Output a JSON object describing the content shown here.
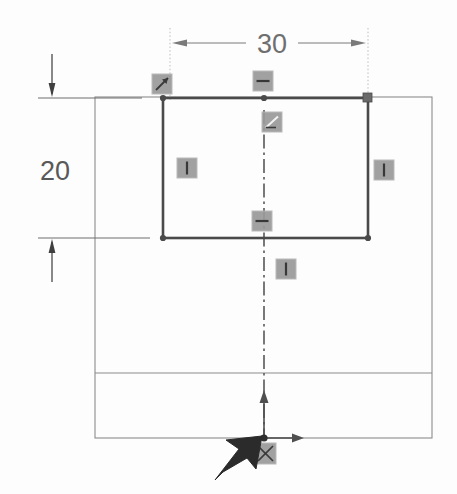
{
  "app": {
    "view_name": "sketch-canvas",
    "background_color": "#fdfdfd"
  },
  "colors": {
    "sketch_line": "#4a4a4a",
    "reference_line": "#8c8c8c",
    "centerline": "#6b6b6b",
    "dimension": "#7a7a7a",
    "dimension_text": "#6f6f6f",
    "constraint_icon_fill": "#9a9a9a",
    "constraint_icon_border": "#b5b5b5",
    "origin_arrow": "#4f4f4f",
    "cursor": "#2b2b2b",
    "handle_fill": "#6a6a6a"
  },
  "dimensions": [
    {
      "id": "width-dimension",
      "value": "30",
      "orientation": "horizontal",
      "label_x": 272,
      "label_y": 53,
      "line_y": 43,
      "ext_left_x": 170,
      "ext_right_x": 368,
      "ext_top_y": 28,
      "ext_bottom_y": 100,
      "arrow_direction": "outward"
    },
    {
      "id": "height-dimension",
      "value": "20",
      "orientation": "vertical",
      "label_x": 40,
      "label_y": 180,
      "line_x": 52,
      "ext_top_y": 98,
      "ext_bottom_y": 238,
      "arrow_direction": "outward"
    }
  ],
  "sketch_rectangle": {
    "name": "active-sketch-rectangle",
    "x1": 163,
    "y1": 98,
    "x2": 368,
    "y2": 238,
    "stroke_width": 2.6,
    "vertices": [
      {
        "name": "vertex-top-left",
        "x": 163,
        "y": 98
      },
      {
        "name": "vertex-top-mid",
        "x": 264,
        "y": 98
      },
      {
        "name": "vertex-top-right",
        "x": 368,
        "y": 98
      },
      {
        "name": "vertex-bottom-left",
        "x": 163,
        "y": 238
      },
      {
        "name": "vertex-bottom-right",
        "x": 368,
        "y": 238
      }
    ]
  },
  "reference_geometry": {
    "outer_rectangle": {
      "x1": 95,
      "y1": 97,
      "x2": 432,
      "y2": 438
    },
    "divider_line_y": 373
  },
  "centerline": {
    "name": "vertical-construction-centerline",
    "x": 264,
    "y_top": 110,
    "y_bottom": 440,
    "style": "dash-dot"
  },
  "constraint_icons": [
    {
      "name": "constraint-icon-coincident",
      "type": "coincident",
      "glyph": "coincident",
      "x": 152,
      "y": 74,
      "w": 20,
      "h": 20
    },
    {
      "name": "constraint-icon-horizontal-top",
      "type": "horizontal",
      "glyph": "horizontal",
      "x": 253,
      "y": 71,
      "w": 20,
      "h": 20
    },
    {
      "name": "constraint-icon-perpendicular",
      "type": "perpendicular",
      "glyph": "perpendicular",
      "x": 262,
      "y": 112,
      "w": 20,
      "h": 20
    },
    {
      "name": "constraint-icon-vertical-left",
      "type": "vertical",
      "glyph": "vertical",
      "x": 177,
      "y": 158,
      "w": 20,
      "h": 20
    },
    {
      "name": "constraint-icon-vertical-right",
      "type": "vertical",
      "glyph": "vertical",
      "x": 374,
      "y": 160,
      "w": 20,
      "h": 20
    },
    {
      "name": "constraint-icon-horizontal-bottom",
      "type": "horizontal",
      "glyph": "horizontal",
      "x": 252,
      "y": 211,
      "w": 20,
      "h": 20
    },
    {
      "name": "constraint-icon-vertical-centerline",
      "type": "vertical",
      "glyph": "vertical",
      "x": 276,
      "y": 259,
      "w": 20,
      "h": 20
    },
    {
      "name": "constraint-icon-origin-coincident",
      "type": "coincident",
      "glyph": "coincident-origin",
      "x": 255,
      "y": 443,
      "w": 21,
      "h": 21
    }
  ],
  "selection_handles": [
    {
      "name": "handle-top-right",
      "x": 363,
      "y": 93,
      "size": 9
    }
  ],
  "origin": {
    "name": "sketch-origin",
    "x": 264,
    "y": 438,
    "x_arrow_length": 40,
    "y_arrow_length": 48
  },
  "cursor": {
    "name": "mouse-cursor",
    "tip_x": 262,
    "tip_y": 436,
    "tail_x": 215,
    "tail_y": 480
  }
}
